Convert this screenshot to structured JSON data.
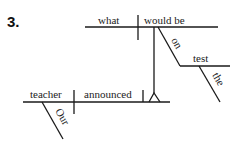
{
  "problem_number": "3.",
  "diagram_type": "sentence diagram",
  "sentence_parts": {
    "subject": "teacher",
    "subject_modifier": "Our",
    "verb": "announced",
    "object_clause": {
      "subject": "what",
      "verb": "would be",
      "preposition": "on",
      "prep_object": "test",
      "prep_object_modifier": "the"
    }
  },
  "colors": {
    "ink": "#1a1a1a",
    "background": "#ffffff"
  }
}
